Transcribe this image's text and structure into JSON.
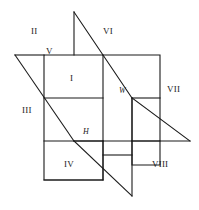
{
  "figure": {
    "type": "geometry-diagram",
    "stroke_color": "#1a1a1a",
    "background_color": "#ffffff",
    "stroke_width": 1.1,
    "width": 199,
    "height": 210
  },
  "plane_labels": [
    {
      "name": "vertical-plane",
      "text": "V",
      "x": 46,
      "y": 52,
      "italic": false
    },
    {
      "name": "profile-plane",
      "text": "W",
      "x": 120,
      "y": 90,
      "italic": true
    },
    {
      "name": "horizontal-plane",
      "text": "H",
      "x": 84,
      "y": 130,
      "italic": true
    }
  ],
  "octant_labels": [
    {
      "name": "octant-1",
      "text": "I",
      "x": 72,
      "y": 80
    },
    {
      "name": "octant-2",
      "text": "II",
      "x": 34,
      "y": 33
    },
    {
      "name": "octant-3",
      "text": "III",
      "x": 25,
      "y": 110
    },
    {
      "name": "octant-4",
      "text": "IV",
      "x": 66,
      "y": 163
    },
    {
      "name": "octant-5",
      "text": "V",
      "x": 46,
      "y": 52
    },
    {
      "name": "octant-6",
      "text": "VI",
      "x": 106,
      "y": 33
    },
    {
      "name": "octant-7",
      "text": "VII",
      "x": 171,
      "y": 89
    },
    {
      "name": "octant-8",
      "text": "VIII",
      "x": 155,
      "y": 163
    }
  ],
  "segments": {
    "frontal_square": [
      [
        44,
        55,
        103,
        55
      ],
      [
        103,
        55,
        103,
        141
      ],
      [
        103,
        141,
        44,
        141
      ],
      [
        44,
        141,
        44,
        55
      ]
    ],
    "upper_frontal": [
      [
        44,
        55,
        44,
        98
      ],
      [
        44,
        98,
        103,
        98
      ]
    ],
    "right_square": [
      [
        103,
        55,
        160,
        55
      ],
      [
        160,
        55,
        160,
        141
      ],
      [
        160,
        141,
        103,
        141
      ]
    ],
    "right_inner": [
      [
        132,
        98,
        160,
        98
      ],
      [
        132,
        98,
        132,
        141
      ]
    ],
    "diag_main": [
      [
        74,
        12,
        132,
        98
      ],
      [
        132,
        98,
        132,
        196
      ]
    ],
    "diag_upper_right": [
      [
        74,
        12,
        132,
        98
      ]
    ],
    "diag_left": [
      [
        15,
        55,
        74,
        141
      ]
    ],
    "diag_lower_right": [
      [
        74,
        141,
        132,
        141
      ],
      [
        103,
        141,
        186,
        141
      ]
    ]
  }
}
